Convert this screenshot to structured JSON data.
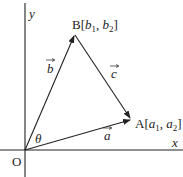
{
  "diagram": {
    "type": "vector-triangle",
    "colors": {
      "ink": "#222222",
      "background": "#ffffff"
    },
    "axes": {
      "x_label": "x",
      "y_label": "y",
      "origin_label": "O"
    },
    "points": {
      "origin": {
        "name": "O",
        "px": [
          25,
          150
        ]
      },
      "A": {
        "name": "A",
        "label_prefix": "A[",
        "coord1": "a",
        "sub1": "1",
        "sep": ", ",
        "coord2": "a",
        "sub2": "2",
        "label_suffix": "]",
        "px": [
          131,
          119
        ]
      },
      "B": {
        "name": "B",
        "label_prefix": "B[",
        "coord1": "b",
        "sub1": "1",
        "sep": ", ",
        "coord2": "b",
        "sub2": "2",
        "label_suffix": "]",
        "px": [
          75,
          35
        ]
      }
    },
    "vectors": [
      {
        "name": "a",
        "label": "a",
        "from": "O",
        "to": "A"
      },
      {
        "name": "b",
        "label": "b",
        "from": "O",
        "to": "B"
      },
      {
        "name": "c",
        "label": "c",
        "from": "B",
        "to": "A"
      }
    ],
    "angle": {
      "label": "θ",
      "between": [
        "a",
        "b"
      ],
      "at": "O"
    }
  }
}
